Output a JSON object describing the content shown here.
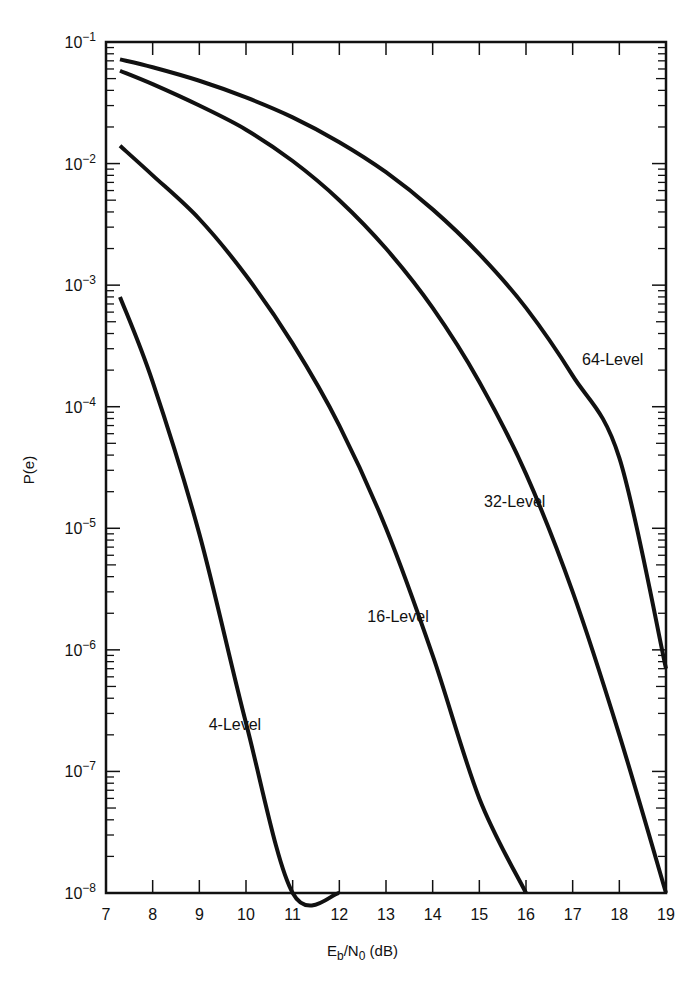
{
  "chart_data": {
    "type": "line",
    "title": "",
    "xlabel": "Eb/N0 (dB)",
    "xlabel_main": "E",
    "xlabel_sub1": "b",
    "xlabel_mid": "/N",
    "xlabel_sub2": "0",
    "xlabel_tail": " (dB)",
    "ylabel": "P(e)",
    "xlim": [
      7,
      19
    ],
    "ylim": [
      1e-08,
      0.1
    ],
    "yscale": "log",
    "grid": false,
    "legend": "inline curve labels",
    "x_ticks": [
      "7",
      "8",
      "9",
      "10",
      "11",
      "12",
      "13",
      "14",
      "15",
      "16",
      "17",
      "18",
      "19"
    ],
    "y_ticks": [
      {
        "base": "10",
        "exp": "−1",
        "value": 0.1
      },
      {
        "base": "10",
        "exp": "−2",
        "value": 0.01
      },
      {
        "base": "10",
        "exp": "−3",
        "value": 0.001
      },
      {
        "base": "10",
        "exp": "−4",
        "value": 0.0001
      },
      {
        "base": "10",
        "exp": "−5",
        "value": 1e-05
      },
      {
        "base": "10",
        "exp": "−6",
        "value": 1e-06
      },
      {
        "base": "10",
        "exp": "−7",
        "value": 1e-07
      },
      {
        "base": "10",
        "exp": "−8",
        "value": 1e-08
      }
    ],
    "series": [
      {
        "name": "4-Level",
        "label_pos": [
          9.2,
          2.2e-07
        ],
        "x": [
          7.3,
          8,
          9,
          10,
          11,
          12
        ],
        "y": [
          0.0008,
          0.00016,
          9e-06,
          2.5e-07,
          4e-09,
          1e-08
        ]
      },
      {
        "name": "16-Level",
        "label_pos": [
          12.6,
          1.7e-06
        ],
        "x": [
          7.3,
          8,
          9,
          10,
          11,
          12,
          13,
          14,
          15,
          16
        ],
        "y": [
          0.014,
          0.008,
          0.0035,
          0.0012,
          0.00033,
          7e-05,
          1e-05,
          9e-07,
          6e-08,
          1e-08
        ]
      },
      {
        "name": "32-Level",
        "label_pos": [
          15.1,
          1.5e-05
        ],
        "x": [
          7.3,
          8,
          9,
          10,
          11,
          12,
          13,
          14,
          15,
          16,
          17,
          18,
          19
        ],
        "y": [
          0.058,
          0.045,
          0.03,
          0.019,
          0.0105,
          0.005,
          0.002,
          0.00065,
          0.00016,
          2.8e-05,
          3e-06,
          2e-07,
          1e-08
        ]
      },
      {
        "name": "64-Level",
        "label_pos": [
          17.2,
          0.00022
        ],
        "x": [
          7.3,
          8,
          9,
          10,
          11,
          12,
          13,
          14,
          15,
          16,
          17,
          18,
          19
        ],
        "y": [
          0.072,
          0.062,
          0.048,
          0.035,
          0.024,
          0.015,
          0.0085,
          0.0042,
          0.0018,
          0.00065,
          0.00018,
          3.8e-05,
          7e-07
        ]
      }
    ]
  }
}
